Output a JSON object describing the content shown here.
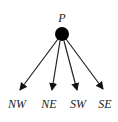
{
  "diagram": {
    "root": {
      "label": "P",
      "x": 62,
      "y": 34,
      "r": 7
    },
    "children": [
      {
        "label": "NW",
        "tip_x": 20,
        "tip_y": 90,
        "label_x": 17
      },
      {
        "label": "NE",
        "tip_x": 52,
        "tip_y": 90,
        "label_x": 49
      },
      {
        "label": "SW",
        "tip_x": 77,
        "tip_y": 90,
        "label_x": 78
      },
      {
        "label": "SE",
        "tip_x": 103,
        "tip_y": 89,
        "label_x": 105
      }
    ],
    "colors": {
      "node": "#000000",
      "edge": "#222222",
      "text": "#222222"
    }
  }
}
